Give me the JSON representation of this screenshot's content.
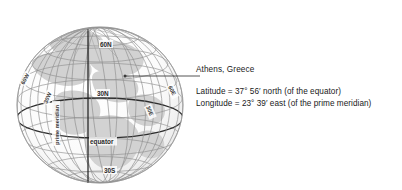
{
  "figure": {
    "type": "globe-diagram",
    "colors": {
      "land": "#d0d0d0",
      "ocean": "#f7f7f7",
      "grid": "#8c8c8c",
      "highlight": "#1a1a1a",
      "outline": "#9a9a9a",
      "text": "#1a1a1a"
    },
    "latitude_labels": [
      {
        "text": "60N",
        "x": 104,
        "y": 46
      },
      {
        "text": "30N",
        "x": 101,
        "y": 95
      },
      {
        "text": "30S",
        "x": 108,
        "y": 172
      }
    ],
    "longitude_labels": [
      {
        "text": "60W",
        "x": 24,
        "y": 85,
        "rotate": -62
      },
      {
        "text": "30W",
        "x": 47,
        "y": 104,
        "rotate": -66
      },
      {
        "text": "30E",
        "x": 146,
        "y": 107,
        "rotate": 66
      },
      {
        "text": "60E",
        "x": 168,
        "y": 87,
        "rotate": 62
      }
    ],
    "special_lines": [
      {
        "name": "equator",
        "label": "equator",
        "x": 115,
        "y": 144
      },
      {
        "name": "prime-meridian",
        "label": "prime meridian",
        "x": 88,
        "y": 100,
        "rotate": -90
      }
    ],
    "marker": {
      "name": "athens-location-dot",
      "x": 125,
      "y": 76
    },
    "pointer_line": {
      "name": "leader-line",
      "x1": 127,
      "y1": 76,
      "x2": 193,
      "y2": 76
    }
  },
  "annotation": {
    "title": "Athens, Greece",
    "latitude_line": "Latitude = 37° 56′ north (of the equator)",
    "longitude_line": "Longitude = 23° 39′ east (of the prime meridian)"
  }
}
